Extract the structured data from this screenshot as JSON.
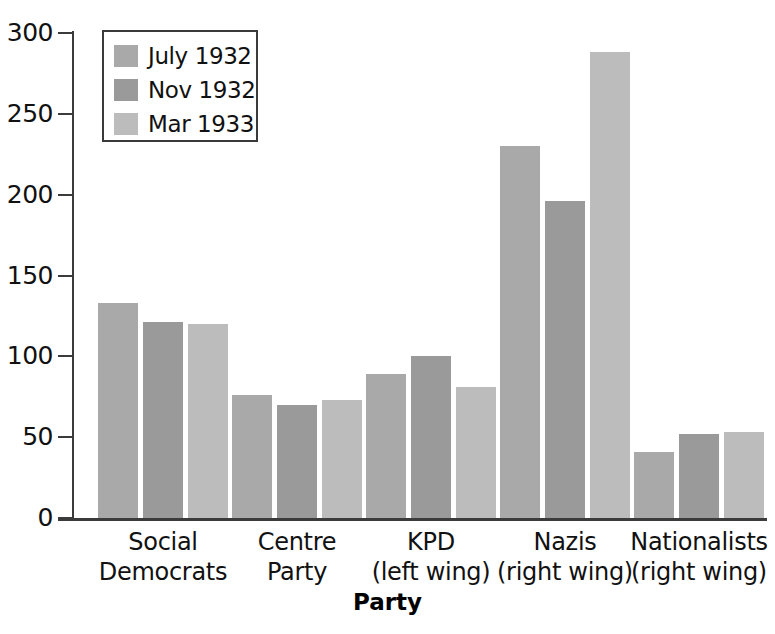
{
  "chart_data": {
    "type": "bar",
    "title": "",
    "subtitle": "",
    "xlabel": "Party",
    "ylabel": "",
    "ylim": [
      0,
      300
    ],
    "yticks": [
      0,
      50,
      100,
      150,
      200,
      250,
      300
    ],
    "ytick_labels": [
      "0",
      "50",
      "100",
      "150",
      "200",
      "250",
      "300"
    ],
    "grid": false,
    "legend_position": "top-left-inside",
    "categories": [
      "Social Democrats",
      "Centre Party",
      "KPD (left wing)",
      "Nazis (right wing)",
      "Nationalists (right wing)"
    ],
    "category_lines": [
      [
        "Social",
        "Democrats"
      ],
      [
        "Centre",
        "Party"
      ],
      [
        "KPD",
        "(left wing)"
      ],
      [
        "Nazis",
        "(right wing)"
      ],
      [
        "Nationalists",
        "(right wing)"
      ]
    ],
    "series": [
      {
        "name": "July 1932",
        "color": "#a9a9a9",
        "values": [
          133,
          76,
          89,
          230,
          41
        ]
      },
      {
        "name": "Nov 1932",
        "color": "#9a9a9a",
        "values": [
          121,
          70,
          100,
          196,
          52
        ]
      },
      {
        "name": "Mar 1933",
        "color": "#bcbcbc",
        "values": [
          120,
          73,
          81,
          288,
          53
        ]
      }
    ]
  },
  "legend": {
    "items": [
      {
        "label": "July 1932",
        "color": "#a9a9a9"
      },
      {
        "label": "Nov 1932",
        "color": "#9a9a9a"
      },
      {
        "label": "Mar 1933",
        "color": "#bcbcbc"
      }
    ]
  },
  "axis": {
    "x_title": "Party"
  },
  "colors": {
    "axis": "#3b3b3b",
    "text": "#111111",
    "background": "#ffffff"
  }
}
